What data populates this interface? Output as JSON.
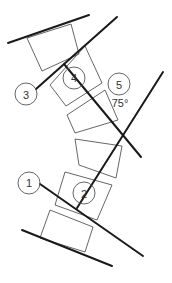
{
  "diagram": {
    "labels": {
      "c1": "1",
      "c2": "2",
      "c3": "3",
      "c4": "4",
      "c5": "5",
      "angle": "75°"
    },
    "colors": {
      "line": "#1a1a1a",
      "outline": "#555555",
      "text": "#333333",
      "background": "#ffffff"
    }
  }
}
